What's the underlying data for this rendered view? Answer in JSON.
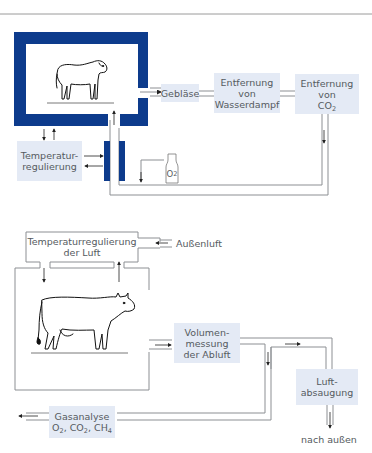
{
  "colors": {
    "frame_dark_blue": "#0d3b8c",
    "box_light_blue": "#e4eaf5",
    "line_gray": "#8c8f93",
    "text_gray": "#555a60"
  },
  "diagram_top": {
    "animal": "sheep",
    "boxes": {
      "geblaese": "Gebläse",
      "wasserdampf_line1": "Entfernung",
      "wasserdampf_line2": "von",
      "wasserdampf_line3": "Wasserdampf",
      "co2_line1": "Entfernung",
      "co2_line2": "von",
      "co2_line3_main": "CO",
      "co2_line3_sub": "2",
      "temp_line1": "Temperatur-",
      "temp_line2": "regulierung"
    },
    "o2_bottle": {
      "main": "O",
      "sub": "2"
    }
  },
  "diagram_bottom": {
    "animal": "cow",
    "boxes": {
      "temp_luft_line1": "Temperaturregulierung",
      "temp_luft_line2": "der Luft",
      "volumen_line1": "Volumen-",
      "volumen_line2": "messung",
      "volumen_line3": "der Abluft",
      "luft_line1": "Luft-",
      "luft_line2": "absaugung",
      "gas_line1": "Gasanalyse",
      "gas_o2": "O",
      "gas_co2": "CO",
      "gas_ch4": "CH",
      "gas_sub2": "2",
      "gas_sub4": "4",
      "gas_sep": ", "
    },
    "labels": {
      "aussenluft": "Außenluft",
      "nach_aussen": "nach außen"
    }
  }
}
